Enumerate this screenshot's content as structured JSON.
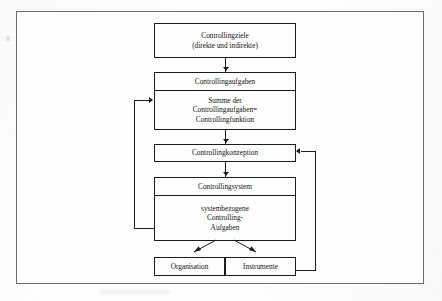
{
  "diagram": {
    "type": "flowchart",
    "nodes": [
      {
        "id": "controllingziele",
        "name": "controllingziele",
        "lines": [
          "Controllingziele",
          "(direkte und indirekte)"
        ]
      },
      {
        "id": "controllingaufgaben",
        "name": "controllingaufgaben",
        "header": "Controllingaufgaben",
        "body": [
          "Summe der",
          "Controllingaufgaben=",
          "Controllingfunktion"
        ]
      },
      {
        "id": "controllingkonzeption",
        "name": "controllingkonzeption",
        "lines": [
          "Controllingkonzeption"
        ]
      },
      {
        "id": "controllingsystem",
        "name": "controllingsystem",
        "header": "Controllingsystem",
        "body": [
          "systembezogene",
          "Controlling-",
          "Aufgaben"
        ]
      },
      {
        "id": "organisation",
        "name": "organisation",
        "lines": [
          "Organisation"
        ]
      },
      {
        "id": "instrumente",
        "name": "instrumente",
        "lines": [
          "Instrumente"
        ]
      }
    ],
    "edges": [
      {
        "id": "e1",
        "from": "controllingziele",
        "to": "controllingaufgaben",
        "style": "arrow-down"
      },
      {
        "id": "e2",
        "from": "controllingaufgaben",
        "to": "controllingkonzeption",
        "style": "arrow-down"
      },
      {
        "id": "e3",
        "from": "controllingkonzeption",
        "to": "controllingsystem",
        "style": "arrow-down"
      },
      {
        "id": "e4",
        "from": "controllingsystem",
        "to": "organisation",
        "style": "diagonal-arrow"
      },
      {
        "id": "e5",
        "from": "controllingsystem",
        "to": "instrumente",
        "style": "diagonal-arrow"
      },
      {
        "id": "e6",
        "from": "controllingsystem",
        "to": "controllingaufgaben",
        "style": "feedback-left"
      },
      {
        "id": "e7",
        "from": "organisation-instrumente-row",
        "to": "controllingkonzeption",
        "style": "feedback-right"
      }
    ]
  },
  "colors": {
    "line": "#1c1c1c",
    "frame": "#6e6e6e",
    "background": "#fefefe",
    "text": "#111111"
  }
}
